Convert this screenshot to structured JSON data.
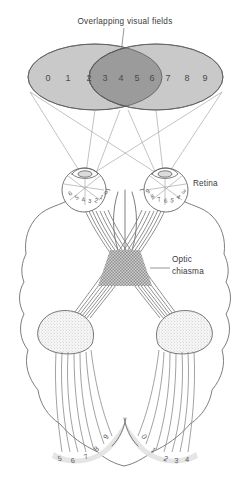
{
  "figure": {
    "title": "Overlapping visual fields",
    "background_color": "#ffffff",
    "width": 251,
    "height": 484
  },
  "visual_field": {
    "title_label": "Overlapping visual fields",
    "numbers": [
      "0",
      "1",
      "2",
      "3",
      "4",
      "5",
      "6",
      "7",
      "8",
      "9"
    ],
    "left_only_numbers": [
      "0",
      "1"
    ],
    "overlap_numbers": [
      "2",
      "3",
      "4",
      "5",
      "6",
      "7"
    ],
    "right_only_numbers": [
      "8",
      "9"
    ],
    "colors": {
      "monocular_field": "#c9c9c9",
      "binocular_overlap": "#9b9b9b",
      "field_outline": "#5d5d5d"
    }
  },
  "annotations": {
    "retina": "Retina",
    "optic_chiasma_line1": "Optic",
    "optic_chiasma_line2": "chiasma"
  },
  "left_eye": {
    "name": "left-eye",
    "retina_numbers": [
      "6",
      "5",
      "4",
      "3",
      "2",
      "1",
      "0"
    ]
  },
  "right_eye": {
    "name": "right-eye",
    "retina_numbers": [
      "9",
      "8",
      "7",
      "6",
      "5",
      "4",
      "3"
    ]
  },
  "visual_cortex": {
    "left_hemisphere_numbers": [
      "5",
      "6",
      "7",
      "8",
      "9"
    ],
    "right_hemisphere_numbers": [
      "0",
      "1",
      "2",
      "3",
      "4"
    ]
  },
  "structures": {
    "brain_outline_color": "#5d5d5d",
    "geniculate_fill": "#f4f4f4",
    "nerve_fiber_color": "#7c7c7c",
    "cortex_shade": "#e2e2e2"
  }
}
